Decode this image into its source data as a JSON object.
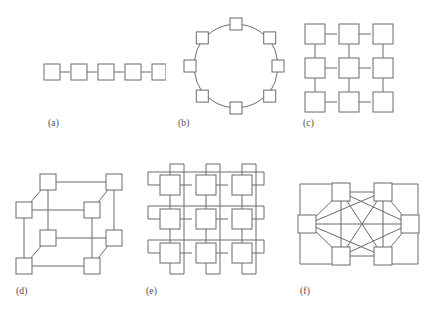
{
  "figure": {
    "background_color": "#ffffff",
    "line_color": "#6b6b6b",
    "node_fill_color": "#ffffff",
    "caption_color": "#4a4a4a",
    "panel_count": 6
  },
  "panels": [
    {
      "key": "a",
      "caption": "(a)",
      "topology_name": "linear-array",
      "node_count": 5,
      "edge_count": 4
    },
    {
      "key": "b",
      "caption": "(b)",
      "topology_name": "ring",
      "node_count": 8,
      "edge_count": 8
    },
    {
      "key": "c",
      "caption": "(c)",
      "topology_name": "mesh-2d",
      "node_count": 9,
      "edge_count": 12
    },
    {
      "key": "d",
      "caption": "(d)",
      "topology_name": "hypercube-3d",
      "node_count": 8,
      "edge_count": 12
    },
    {
      "key": "e",
      "caption": "(e)",
      "topology_name": "torus",
      "node_count": 9,
      "edge_count": 18
    },
    {
      "key": "f",
      "caption": "(f)",
      "topology_name": "fully-connected",
      "node_count": 6,
      "edge_count": 15
    }
  ]
}
